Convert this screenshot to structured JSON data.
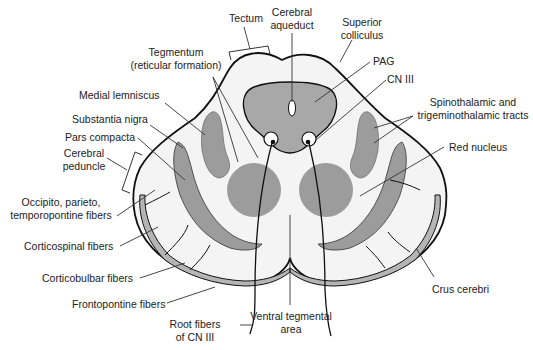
{
  "diagram": {
    "colors": {
      "background": "#ffffff",
      "tissue": "#f4f4f4",
      "gray_structure": "#9c9c9c",
      "pag": "#a8a8a8",
      "outline": "#111111",
      "leader": "#333333",
      "text": "#222222"
    },
    "labels": {
      "tectum": "Tectum",
      "cerebral_aqueduct_1": "Cerebral",
      "cerebral_aqueduct_2": "aqueduct",
      "superior_colliculus_1": "Superior",
      "superior_colliculus_2": "colliculus",
      "tegmentum_1": "Tegmentum",
      "tegmentum_2": "(reticular formation)",
      "pag": "PAG",
      "cn_iii": "CN III",
      "medial_lemniscus": "Medial lemniscus",
      "spinothalamic_1": "Spinothalamic and",
      "spinothalamic_2": "trigeminothalamic tracts",
      "substantia_nigra": "Substantia nigra",
      "pars_compacta": "Pars compacta",
      "red_nucleus": "Red nucleus",
      "cerebral_peduncle_1": "Cerebral",
      "cerebral_peduncle_2": "peduncle",
      "occipito_1": "Occipito, parieto,",
      "occipito_2": "temporopontine fibers",
      "corticospinal": "Corticospinal fibers",
      "corticobulbar": "Corticobulbar fibers",
      "frontopontine": "Frontopontine fibers",
      "crus_cerebri": "Crus cerebri",
      "root_fibers_1": "Root fibers",
      "root_fibers_2": "of CN III",
      "vta_1": "Ventral tegmental",
      "vta_2": "area"
    }
  }
}
